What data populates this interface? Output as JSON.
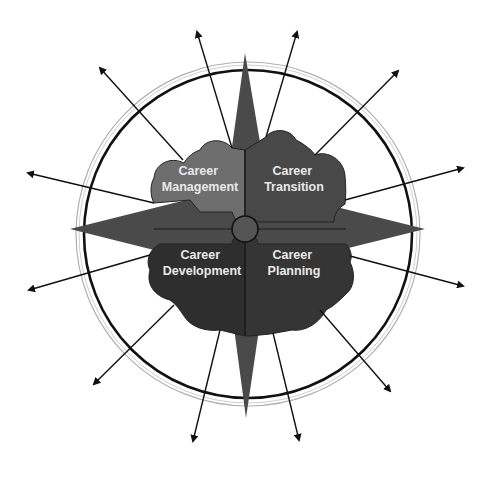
{
  "diagram": {
    "title": "",
    "center": {
      "x": 247,
      "y": 230
    },
    "colors": {
      "background": "#ffffff",
      "star": "#4a4a4a",
      "management": "#6e6e6e",
      "transition": "#484848",
      "development": "#2e2e2e",
      "planning": "#353535",
      "outer_ring": "#111111",
      "inner_ring": "#9a9a9a",
      "label": "#e8e8e8"
    },
    "quadrants": [
      {
        "id": "management",
        "line1": "Career",
        "line2": "Management"
      },
      {
        "id": "transition",
        "line1": "Career",
        "line2": "Transition"
      },
      {
        "id": "development",
        "line1": "Career",
        "line2": "Development"
      },
      {
        "id": "planning",
        "line1": "Career",
        "line2": "Planning"
      }
    ],
    "arrows": [
      {
        "from": [
          232,
          148
        ],
        "to": [
          197,
          32
        ]
      },
      {
        "from": [
          183,
          160
        ],
        "to": [
          100,
          68
        ]
      },
      {
        "from": [
          154,
          203
        ],
        "to": [
          28,
          173
        ]
      },
      {
        "from": [
          266,
          137
        ],
        "to": [
          297,
          32
        ]
      },
      {
        "from": [
          315,
          155
        ],
        "to": [
          398,
          71
        ]
      },
      {
        "from": [
          345,
          200
        ],
        "to": [
          463,
          168
        ]
      },
      {
        "from": [
          150,
          255
        ],
        "to": [
          29,
          290
        ]
      },
      {
        "from": [
          174,
          305
        ],
        "to": [
          94,
          384
        ]
      },
      {
        "from": [
          220,
          330
        ],
        "to": [
          193,
          441
        ]
      },
      {
        "from": [
          350,
          256
        ],
        "to": [
          463,
          286
        ]
      },
      {
        "from": [
          320,
          310
        ],
        "to": [
          390,
          391
        ]
      },
      {
        "from": [
          273,
          333
        ],
        "to": [
          299,
          440
        ]
      }
    ]
  }
}
